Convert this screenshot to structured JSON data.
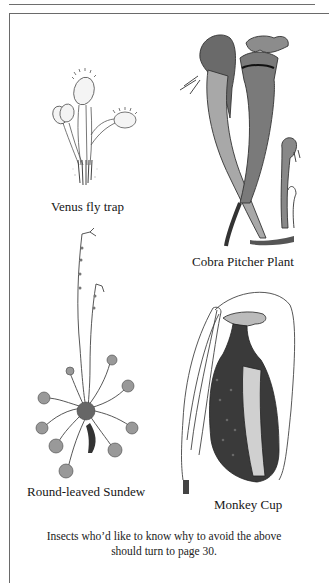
{
  "page": {
    "illustrations": [
      {
        "id": "venus",
        "label": "Venus fly trap"
      },
      {
        "id": "cobra",
        "label": "Cobra Pitcher Plant"
      },
      {
        "id": "sundew",
        "label": "Round-leaved Sundew"
      },
      {
        "id": "monkey",
        "label": "Monkey Cup"
      }
    ],
    "caption_line1": "Insects who’d like to know why to avoid the above",
    "caption_line2": "should turn to page 30."
  },
  "colors": {
    "ink": "#1a1a1a",
    "border": "#6a6a6a",
    "paper": "#ffffff"
  }
}
